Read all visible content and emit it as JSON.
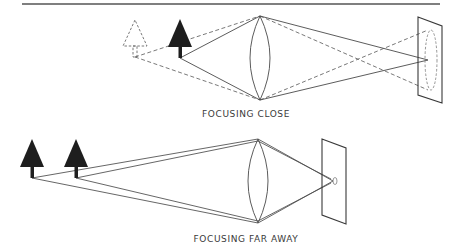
{
  "figure": {
    "type": "optics-diagram"
  },
  "panels": [
    {
      "id": "close",
      "label": "FOCUSING CLOSE",
      "objects": [
        {
          "name": "virtual-tree",
          "style": "dashed-outline"
        },
        {
          "name": "near-tree",
          "style": "solid"
        }
      ],
      "lens": "biconvex",
      "screen": {
        "spot": "dashed blur circle"
      }
    },
    {
      "id": "far",
      "label": "FOCUSING FAR AWAY",
      "objects": [
        {
          "name": "far-tree-1",
          "style": "solid"
        },
        {
          "name": "far-tree-2",
          "style": "solid"
        }
      ],
      "lens": "biconvex",
      "screen": {
        "spot": "small focused point"
      }
    }
  ],
  "colors": {
    "ink": "#2a2a2a",
    "line": "#4a4a4a",
    "dash": "#6a6a6a",
    "rule": "#555555",
    "background": "#ffffff"
  }
}
